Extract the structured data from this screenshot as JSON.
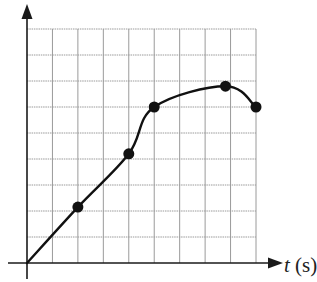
{
  "chart_data": {
    "type": "line",
    "title": "",
    "xlabel": "t (s)",
    "xlabel_var": "t",
    "xlabel_unit": "(s)",
    "ylabel": "",
    "xlim": [
      0,
      9
    ],
    "ylim": [
      0,
      9
    ],
    "grid": true,
    "grid_cols": 9,
    "grid_rows": 9,
    "legend": null,
    "tick_labels": {
      "x": [],
      "y": []
    },
    "series": [
      {
        "name": "curve",
        "smooth": true,
        "x": [
          0,
          2,
          4,
          5,
          7.8,
          9
        ],
        "y": [
          0,
          2.15,
          4.2,
          6.0,
          6.8,
          6.0
        ]
      }
    ],
    "markers": [
      {
        "x": 2,
        "y": 2.15
      },
      {
        "x": 4,
        "y": 4.2
      },
      {
        "x": 5,
        "y": 6.0
      },
      {
        "x": 7.8,
        "y": 6.8
      },
      {
        "x": 9,
        "y": 6.0
      }
    ]
  },
  "colors": {
    "axis": "#1a1a1a",
    "grid": "#9a9a9a",
    "curve": "#111111",
    "marker": "#111111"
  }
}
